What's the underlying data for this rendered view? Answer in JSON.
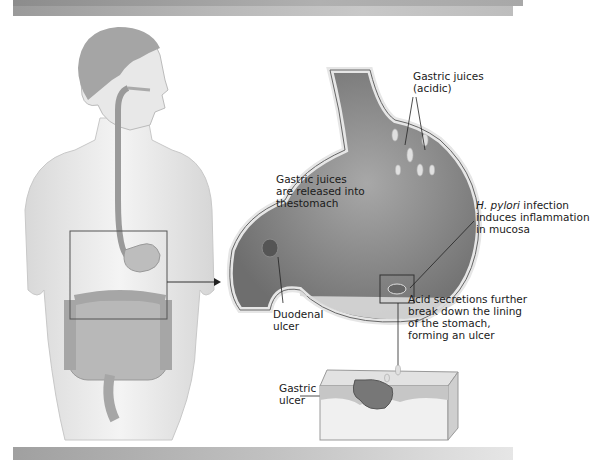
{
  "figure": {
    "type": "anatomical illustration",
    "panels": [
      {
        "id": "body",
        "description": "Human torso with digestive tract; box highlights stomach region"
      },
      {
        "id": "stomach",
        "description": "Enlarged cutaway of stomach and duodenum"
      },
      {
        "id": "tissue-block",
        "description": "Cross-section of stomach lining showing gastric ulcer"
      }
    ]
  },
  "labels": {
    "gastric_juices_acidic": {
      "line1": "Gastric juices",
      "line2": "(acidic)"
    },
    "gastric_juices_released": {
      "line1": "Gastric juices",
      "line2": "are released into",
      "line3": "thestomach"
    },
    "h_pylori": {
      "italic": "H. pylori",
      "line1_rest": " infection",
      "line2": "induces inflammation",
      "line3": "in mucosa"
    },
    "duodenal_ulcer": {
      "line1": "Duodenal",
      "line2": "ulcer"
    },
    "acid_secretions": {
      "line1": "Acid secretions further",
      "line2": "break down the lining",
      "line3": "of the stomach,",
      "line4": "forming an ulcer"
    },
    "gastric_ulcer": {
      "line1": "Gastric",
      "line2": "ulcer"
    }
  },
  "colors": {
    "band_dark": "#9a9a9a",
    "band_light": "#d0d0d0",
    "skin": "#e8e8e8",
    "organ": "#bdbdbd",
    "stomach_interior": "#8e8e8e",
    "line": "#222222"
  }
}
